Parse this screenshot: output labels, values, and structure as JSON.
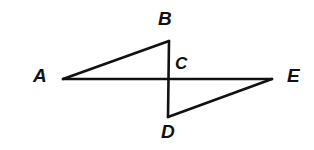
{
  "figure": {
    "type": "geometry-diagram",
    "background_color": "#ffffff",
    "stroke_color": "#111111",
    "stroke_width": 2.6,
    "canvas": {
      "width": 314,
      "height": 150
    },
    "points": {
      "A": {
        "label": "A",
        "x": 63,
        "y": 79
      },
      "B": {
        "label": "B",
        "x": 169,
        "y": 41
      },
      "C": {
        "label": "C",
        "x": 169,
        "y": 79
      },
      "D": {
        "label": "D",
        "x": 168,
        "y": 117
      },
      "E": {
        "label": "E",
        "x": 272,
        "y": 79
      }
    },
    "segments": [
      {
        "name": "AE",
        "from": "A",
        "to": "E"
      },
      {
        "name": "BD",
        "from": "B",
        "to": "D"
      },
      {
        "name": "AB",
        "from": "A",
        "to": "B"
      },
      {
        "name": "DE",
        "from": "D",
        "to": "E"
      }
    ],
    "labels": {
      "A": "A",
      "B": "B",
      "C": "C",
      "D": "D",
      "E": "E"
    }
  }
}
